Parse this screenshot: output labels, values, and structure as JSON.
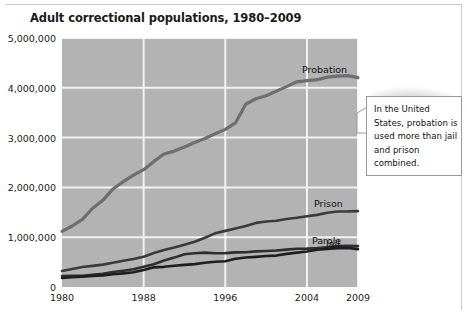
{
  "figure": {
    "title": "Adult correctional populations, 1980–2009",
    "callout": "In the United States, probation is used more than jail and prison combined."
  },
  "chart_data": {
    "type": "line",
    "title": "Adult correctional populations, 1980–2009",
    "xlabel": "",
    "ylabel": "",
    "xlim": [
      1980,
      2009
    ],
    "ylim": [
      0,
      5000000
    ],
    "grid": true,
    "legend_position": "inline-right-of-series",
    "xticks": [
      1980,
      1988,
      1996,
      2004,
      2009
    ],
    "xtick_labels": [
      "1980",
      "1988",
      "1996",
      "2004",
      "2009"
    ],
    "yticks": [
      0,
      1000000,
      2000000,
      3000000,
      4000000,
      5000000
    ],
    "ytick_labels": [
      "0",
      "1,000,000",
      "2,000,000",
      "3,000,000",
      "4,000,000",
      "5,000,000"
    ],
    "x": [
      1980,
      1981,
      1982,
      1983,
      1984,
      1985,
      1986,
      1987,
      1988,
      1989,
      1990,
      1991,
      1992,
      1993,
      1994,
      1995,
      1996,
      1997,
      1998,
      1999,
      2000,
      2001,
      2002,
      2003,
      2004,
      2005,
      2006,
      2007,
      2008,
      2009
    ],
    "series": [
      {
        "name": "Probation",
        "color": "#6e6e6e",
        "values": [
          1118000,
          1225000,
          1357000,
          1582000,
          1740000,
          1969000,
          2115000,
          2247000,
          2356000,
          2522000,
          2670000,
          2729000,
          2812000,
          2903000,
          2981000,
          3078000,
          3165000,
          3297000,
          3671000,
          3780000,
          3839000,
          3934000,
          4024000,
          4120000,
          4144000,
          4163000,
          4215000,
          4234000,
          4244000,
          4203000
        ]
      },
      {
        "name": "Prison",
        "color": "#3a3a3a",
        "values": [
          320000,
          360000,
          402000,
          424000,
          449000,
          487000,
          526000,
          562000,
          607000,
          683000,
          743000,
          792000,
          850000,
          909000,
          990000,
          1078000,
          1127000,
          1176000,
          1224000,
          1287000,
          1316000,
          1330000,
          1367000,
          1390000,
          1421000,
          1448000,
          1492000,
          1517000,
          1518000,
          1524000
        ]
      },
      {
        "name": "Parole",
        "color": "#2e2e2e",
        "values": [
          220000,
          226000,
          224000,
          246000,
          266000,
          300000,
          326000,
          355000,
          407000,
          456000,
          531000,
          590000,
          658000,
          677000,
          690000,
          679000,
          680000,
          695000,
          697000,
          715000,
          724000,
          732000,
          750000,
          769000,
          771000,
          780000,
          799000,
          821000,
          828000,
          820000
        ]
      },
      {
        "name": "Jail",
        "color": "#1e1e1e",
        "values": [
          182000,
          196000,
          209000,
          224000,
          234000,
          256000,
          274000,
          295000,
          343000,
          395000,
          405000,
          426000,
          445000,
          459000,
          486000,
          507000,
          518000,
          567000,
          592000,
          605000,
          621000,
          631000,
          665000,
          691000,
          714000,
          747000,
          766000,
          780000,
          785000,
          760000
        ]
      }
    ]
  }
}
